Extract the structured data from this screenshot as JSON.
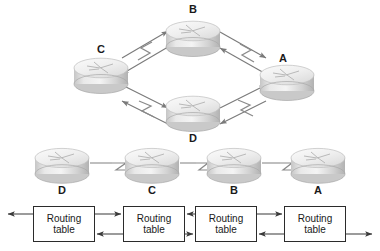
{
  "figure": {
    "background_color": "#ffffff",
    "line_color": "#6b6b6b",
    "box_border_color": "#2b2b2b",
    "text_color": "#1a1a1a",
    "router_body_light": "#f2f2f2",
    "router_body_mid": "#d8d8d8",
    "router_body_dark": "#b4b4b4"
  },
  "topology": {
    "name": "ring-topology",
    "layout": "diamond",
    "routers": [
      {
        "id": "B",
        "label": "B",
        "position": "top",
        "cx": 193,
        "cy": 38,
        "label_x": 193,
        "label_y": 8
      },
      {
        "id": "C",
        "label": "C",
        "position": "left",
        "cx": 101,
        "cy": 75,
        "label_x": 101,
        "label_y": 49
      },
      {
        "id": "A",
        "label": "A",
        "position": "right",
        "cx": 287,
        "cy": 82,
        "label_x": 283,
        "label_y": 58
      },
      {
        "id": "D",
        "label": "D",
        "position": "bottom",
        "cx": 193,
        "cy": 113,
        "label_x": 193,
        "label_y": 138
      }
    ],
    "links": [
      {
        "from": "C",
        "to": "B",
        "type": "serial",
        "bidirectional": true
      },
      {
        "from": "B",
        "to": "A",
        "type": "serial",
        "bidirectional": true
      },
      {
        "from": "A",
        "to": "D",
        "type": "serial",
        "bidirectional": true
      },
      {
        "from": "D",
        "to": "C",
        "type": "serial",
        "bidirectional": true
      }
    ]
  },
  "chain": {
    "name": "linear-chain",
    "routers": [
      {
        "id": "D",
        "label": "D",
        "cx": 62,
        "cy": 166,
        "label_x": 62,
        "label_y": 190
      },
      {
        "id": "C",
        "label": "C",
        "cx": 152,
        "cy": 166,
        "label_x": 152,
        "label_y": 190
      },
      {
        "id": "B",
        "label": "B",
        "cx": 234,
        "cy": 166,
        "label_x": 234,
        "label_y": 190
      },
      {
        "id": "A",
        "label": "A",
        "cx": 318,
        "cy": 166,
        "label_x": 318,
        "label_y": 190
      }
    ],
    "links": [
      {
        "from": "D",
        "to": "C",
        "type": "serial"
      },
      {
        "from": "C",
        "to": "B",
        "type": "serial"
      },
      {
        "from": "B",
        "to": "A",
        "type": "serial"
      }
    ]
  },
  "routing_tables": {
    "label": "Routing\ntable",
    "boxes": [
      {
        "router": "D",
        "label": "Routing\ntable",
        "x": 33,
        "y": 206,
        "w": 62,
        "h": 36
      },
      {
        "router": "C",
        "label": "Routing\ntable",
        "x": 123,
        "y": 206,
        "w": 62,
        "h": 36
      },
      {
        "router": "B",
        "label": "Routing\ntable",
        "x": 195,
        "y": 206,
        "w": 62,
        "h": 36
      },
      {
        "router": "A",
        "label": "Routing\ntable",
        "x": 284,
        "y": 206,
        "w": 62,
        "h": 36
      }
    ],
    "update_arrows": [
      {
        "id": "edge-left-out",
        "from": "D",
        "to": "outside",
        "direction": "left",
        "row": "top"
      },
      {
        "id": "d-to-c",
        "from": "D",
        "to": "C",
        "direction": "right",
        "row": "top"
      },
      {
        "id": "c-to-d",
        "from": "C",
        "to": "D",
        "direction": "left",
        "row": "bottom"
      },
      {
        "id": "b-to-c",
        "from": "B",
        "to": "C",
        "direction": "left",
        "row": "top"
      },
      {
        "id": "c-to-b",
        "from": "C",
        "to": "B",
        "direction": "right",
        "row": "bottom"
      },
      {
        "id": "b-to-a",
        "from": "B",
        "to": "A",
        "direction": "right",
        "row": "top"
      },
      {
        "id": "a-to-b",
        "from": "A",
        "to": "B",
        "direction": "left",
        "row": "bottom"
      },
      {
        "id": "edge-right-out",
        "from": "A",
        "to": "outside",
        "direction": "right",
        "row": "bottom"
      }
    ]
  }
}
